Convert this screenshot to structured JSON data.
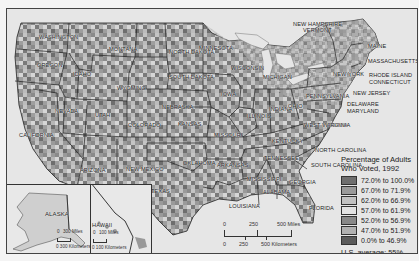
{
  "map": {
    "title": "Percentage of Adults Who Voted, 1992",
    "region": "United States (counties)",
    "background_color": "#e6e6e6",
    "state_labels": [
      {
        "name": "WASHINGTON",
        "x": 32,
        "y": 25
      },
      {
        "name": "OREGON",
        "x": 30,
        "y": 53
      },
      {
        "name": "IDAHO",
        "x": 66,
        "y": 62
      },
      {
        "name": "MONTANA",
        "x": 102,
        "y": 37
      },
      {
        "name": "WYOMING",
        "x": 110,
        "y": 76
      },
      {
        "name": "NORTH DAKOTA",
        "x": 162,
        "y": 40
      },
      {
        "name": "MINNESOTA",
        "x": 192,
        "y": 36
      },
      {
        "name": "SOUTH DAKOTA",
        "x": 162,
        "y": 65
      },
      {
        "name": "WISCONSIN",
        "x": 224,
        "y": 56
      },
      {
        "name": "MICHIGAN",
        "x": 256,
        "y": 65
      },
      {
        "name": "NEVADA",
        "x": 48,
        "y": 99
      },
      {
        "name": "UTAH",
        "x": 88,
        "y": 103
      },
      {
        "name": "COLORADO",
        "x": 121,
        "y": 113
      },
      {
        "name": "NEBRASKA",
        "x": 155,
        "y": 95
      },
      {
        "name": "IOWA",
        "x": 214,
        "y": 82
      },
      {
        "name": "ILLINOIS",
        "x": 240,
        "y": 104
      },
      {
        "name": "INDIANA",
        "x": 262,
        "y": 97
      },
      {
        "name": "OHIO",
        "x": 281,
        "y": 94
      },
      {
        "name": "KANSAS",
        "x": 171,
        "y": 112
      },
      {
        "name": "MISSOURI",
        "x": 207,
        "y": 123
      },
      {
        "name": "KENTUCKY",
        "x": 265,
        "y": 129
      },
      {
        "name": "WEST VIRGINIA",
        "x": 297,
        "y": 113
      },
      {
        "name": "VIRGINIA",
        "x": 318,
        "y": 113
      },
      {
        "name": "CALIFORNIA",
        "x": 12,
        "y": 123
      },
      {
        "name": "ARIZONA",
        "x": 73,
        "y": 158
      },
      {
        "name": "NEW MEXICO",
        "x": 119,
        "y": 157
      },
      {
        "name": "OKLAHOMA",
        "x": 176,
        "y": 151
      },
      {
        "name": "ARKANSAS",
        "x": 210,
        "y": 153
      },
      {
        "name": "TENNESSEE",
        "x": 257,
        "y": 146
      },
      {
        "name": "NORTH CAROLINA",
        "x": 308,
        "y": 138
      },
      {
        "name": "SOUTH CAROLINA",
        "x": 304,
        "y": 153
      },
      {
        "name": "TEXAS",
        "x": 144,
        "y": 179
      },
      {
        "name": "MISSISSIPPI",
        "x": 240,
        "y": 167
      },
      {
        "name": "ALABAMA",
        "x": 256,
        "y": 180
      },
      {
        "name": "GEORGIA",
        "x": 282,
        "y": 170
      },
      {
        "name": "LOUISIANA",
        "x": 222,
        "y": 194
      },
      {
        "name": "FLORIDA",
        "x": 302,
        "y": 196
      },
      {
        "name": "NEW YORK",
        "x": 326,
        "y": 62
      },
      {
        "name": "PENNSYLVANIA",
        "x": 299,
        "y": 84
      },
      {
        "name": "MAINE",
        "x": 361,
        "y": 34
      },
      {
        "name": "NEW HAMPSHIRE",
        "x": 286,
        "y": 12
      },
      {
        "name": "VERMONT",
        "x": 296,
        "y": 18
      },
      {
        "name": "MASSACHUSETTS",
        "x": 361,
        "y": 49
      },
      {
        "name": "RHODE ISLAND",
        "x": 362,
        "y": 63
      },
      {
        "name": "CONNECTICUT",
        "x": 362,
        "y": 70
      },
      {
        "name": "NEW JERSEY",
        "x": 346,
        "y": 81
      },
      {
        "name": "DELAWARE",
        "x": 340,
        "y": 92
      },
      {
        "name": "MARYLAND",
        "x": 340,
        "y": 99
      }
    ],
    "insets": {
      "alaska": {
        "label": "ALASKA",
        "scale_miles": "300 Miles",
        "scale_km": "0  300 Kilometers",
        "scale_zero": "0"
      },
      "hawaii": {
        "label": "HAWAII",
        "scale_miles": "100 Miles",
        "scale_km": "0  100 Kilometers",
        "scale_zero": "0"
      }
    },
    "scale_bar": {
      "miles": [
        "0",
        "250",
        "500 Miles"
      ],
      "km": [
        "0",
        "250",
        "500 Kilometers"
      ]
    }
  },
  "legend": {
    "title_line1": "Percentage of Adults",
    "title_line2": "Who Voted, 1992",
    "classes": [
      {
        "label": "72.0% to 100.0%",
        "color": "#6e6e6e"
      },
      {
        "label": "67.0% to 71.9%",
        "color": "#9a9a9a"
      },
      {
        "label": "62.0% to 66.9%",
        "color": "#c2c2c2"
      },
      {
        "label": "57.0% to 61.9%",
        "color": "#e2e2e2"
      },
      {
        "label": "52.0% to 56.9%",
        "color": "#888888"
      },
      {
        "label": "47.0% to 51.9%",
        "color": "#b0b0b0"
      },
      {
        "label": "0.0% to 46.9%",
        "color": "#5a5a5a"
      }
    ],
    "average_label": "U.S. average:  55%"
  }
}
